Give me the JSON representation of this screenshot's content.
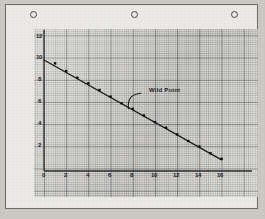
{
  "page": {
    "media": "engineering-graph-paper-scan",
    "punch_holes": 3
  },
  "chart_data": {
    "type": "scatter",
    "title": "",
    "xlabel": "",
    "ylabel": "",
    "xlim": [
      0,
      17
    ],
    "ylim": [
      0,
      13
    ],
    "grid": true,
    "legend": false,
    "x_ticks": [
      "0",
      "2",
      "4",
      "6",
      "8",
      "10",
      "12",
      "14",
      "16"
    ],
    "x_tick_values": [
      0,
      2,
      4,
      6,
      8,
      10,
      12,
      14,
      16
    ],
    "y_ticks": [
      "2",
      "4",
      "6",
      "8",
      "10",
      "12"
    ],
    "y_tick_values": [
      2,
      4,
      6,
      8,
      10,
      12
    ],
    "series": [
      {
        "name": "fitted line",
        "type": "line",
        "x": [
          0,
          16
        ],
        "y": [
          10.0,
          1.0
        ]
      },
      {
        "name": "measured points",
        "type": "scatter",
        "x": [
          1,
          2,
          3,
          4,
          5,
          6,
          7,
          8,
          9,
          10,
          11,
          12,
          13,
          14,
          15,
          16
        ],
        "y": [
          9.7,
          9.0,
          8.4,
          7.9,
          7.3,
          6.7,
          6.1,
          5.6,
          5.0,
          4.4,
          3.9,
          3.3,
          2.7,
          2.2,
          1.6,
          1.1
        ]
      }
    ],
    "annotations": [
      {
        "text": "Wild Point",
        "text_x": 9.0,
        "text_y": 7.1,
        "points_to_x": 7.6,
        "points_to_y": 5.6,
        "style": "curved-leader-line"
      }
    ]
  },
  "annotation_label": "Wild Point"
}
